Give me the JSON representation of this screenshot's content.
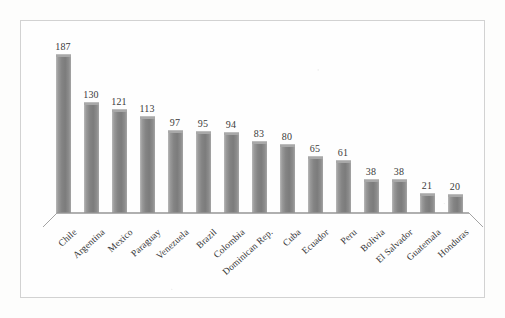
{
  "chart_data": {
    "type": "bar",
    "title": "",
    "subtitle": "",
    "xlabel": "",
    "ylabel": "",
    "ylim": [
      0,
      200
    ],
    "grid": false,
    "legend": false,
    "orientation": "vertical",
    "data_labels": true,
    "categories": [
      "Chile",
      "Argentina",
      "Mexico",
      "Paraguay",
      "Venezuela",
      "Brazil",
      "Colombia",
      "Dominican Rep.",
      "Cuba",
      "Ecuador",
      "Peru",
      "Bolivia",
      "El Salvador",
      "Guatemala",
      "Honduras"
    ],
    "values": [
      187,
      130,
      121,
      113,
      97,
      95,
      94,
      83,
      80,
      65,
      61,
      38,
      38,
      21,
      20
    ],
    "value_labels": [
      "187",
      "130",
      "121",
      "113",
      "97",
      "95",
      "94",
      "83",
      "80",
      "65",
      "61",
      "38",
      "38",
      "21",
      "20"
    ],
    "series": [
      {
        "name": "",
        "values": [
          187,
          130,
          121,
          113,
          97,
          95,
          94,
          83,
          80,
          65,
          61,
          38,
          38,
          21,
          20
        ]
      }
    ]
  },
  "style": {
    "bar_color": "#848484",
    "bar_highlight": "#b9b9b9",
    "frame_color": "#d2d2d2",
    "axis_color": "#9c9c9c",
    "text_color": "#39393a",
    "background": "#fdfdfc"
  }
}
